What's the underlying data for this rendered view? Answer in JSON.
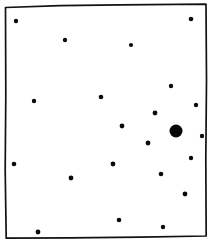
{
  "figure": {
    "title": "Scatter field of points inside hand-drawn frame",
    "background_color": "#ffffff",
    "ink_color": "#111111",
    "width": 212,
    "height": 246
  },
  "frame": {
    "name": "hand-drawn-rectangle",
    "stroke_color": "#111111",
    "stroke_width": 1.7,
    "corners": {
      "top_left": [
        5,
        7
      ],
      "top_right": [
        206,
        4
      ],
      "bottom_right": [
        206,
        236
      ],
      "bottom_left": [
        6,
        238
      ]
    },
    "path": "M 5.5 7.5 L 60 5.6 L 120 4.8 L 206 4.2 L 206.5 80 L 205.8 160 L 206.2 236 L 140 237.2 L 70 237.8 L 6.2 238.2 L 5.2 170 L 5.8 95 Z"
  },
  "chart_data": {
    "type": "scatter",
    "title": "",
    "xlabel": "",
    "ylabel": "",
    "xlim": [
      0,
      212
    ],
    "ylim": [
      0,
      246
    ],
    "grid": false,
    "legend": "none",
    "note": "Pixel coordinates in image space; y increases downward. r is dot radius in px.",
    "point_count": 23,
    "points": [
      {
        "x": 16,
        "y": 21,
        "r": 2.2,
        "size": "small"
      },
      {
        "x": 65,
        "y": 40,
        "r": 2.2,
        "size": "small"
      },
      {
        "x": 131,
        "y": 45,
        "r": 2.1,
        "size": "small"
      },
      {
        "x": 191,
        "y": 19,
        "r": 2.3,
        "size": "small"
      },
      {
        "x": 101,
        "y": 97,
        "r": 2.3,
        "size": "small"
      },
      {
        "x": 34,
        "y": 101,
        "r": 2.2,
        "size": "small"
      },
      {
        "x": 171,
        "y": 86,
        "r": 2.2,
        "size": "small"
      },
      {
        "x": 196,
        "y": 105,
        "r": 2.2,
        "size": "small"
      },
      {
        "x": 155,
        "y": 113,
        "r": 2.4,
        "size": "small"
      },
      {
        "x": 122,
        "y": 126,
        "r": 2.4,
        "size": "small"
      },
      {
        "x": 148,
        "y": 143,
        "r": 2.4,
        "size": "small"
      },
      {
        "x": 176,
        "y": 131,
        "r": 6.5,
        "size": "large"
      },
      {
        "x": 202,
        "y": 136,
        "r": 2.2,
        "size": "small"
      },
      {
        "x": 191,
        "y": 158,
        "r": 2.2,
        "size": "small"
      },
      {
        "x": 14,
        "y": 164,
        "r": 2.3,
        "size": "small"
      },
      {
        "x": 113,
        "y": 164,
        "r": 2.4,
        "size": "small"
      },
      {
        "x": 71,
        "y": 178,
        "r": 2.4,
        "size": "small"
      },
      {
        "x": 161,
        "y": 174,
        "r": 2.3,
        "size": "small"
      },
      {
        "x": 185,
        "y": 194,
        "r": 2.4,
        "size": "small"
      },
      {
        "x": 119,
        "y": 220,
        "r": 2.3,
        "size": "small"
      },
      {
        "x": 163,
        "y": 227,
        "r": 2.2,
        "size": "small"
      },
      {
        "x": 38,
        "y": 232,
        "r": 2.4,
        "size": "small"
      },
      {
        "x": 176,
        "y": 131,
        "r": 0,
        "size": "duplicate-ignore"
      }
    ]
  }
}
